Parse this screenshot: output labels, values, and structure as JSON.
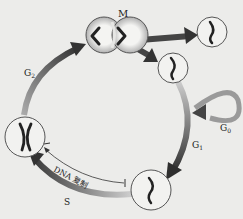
{
  "diagram": {
    "labels": {
      "M": "M",
      "G2": "G",
      "G2_sub": "2",
      "G0": "G",
      "G0_sub": "0",
      "G1": "G",
      "G1_sub": "1",
      "S": "S",
      "dna_replication": "DNA 复制"
    },
    "phases": [
      "G1",
      "S",
      "G2",
      "M",
      "G0"
    ],
    "colors": {
      "background": "#ececea",
      "arrow_dark": "#333333",
      "arrow_light": "#bdbdbd",
      "cell_outline": "#555555",
      "chromosome": "#222222"
    }
  }
}
